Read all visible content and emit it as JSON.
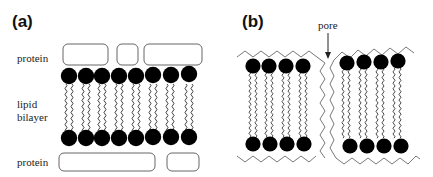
{
  "panels": {
    "a": {
      "label": "(a)",
      "labels": {
        "top_protein": "protein",
        "bilayer_line1": "lipid",
        "bilayer_line2": "bilayer",
        "bottom_protein": "protein"
      },
      "lipid_count_per_leaflet": 8,
      "top_protein_count": 3,
      "bottom_protein_count": 2
    },
    "b": {
      "label": "(b)",
      "pore_label": "pore",
      "left_lipid_count_per_leaflet": 4,
      "right_lipid_count_per_leaflet": 4
    }
  },
  "colors": {
    "head": "#000000",
    "outline": "#555555",
    "background": "#ffffff"
  }
}
